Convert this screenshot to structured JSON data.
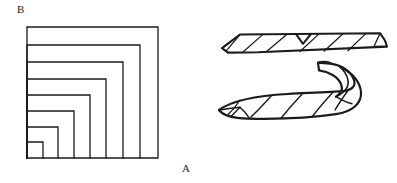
{
  "figure": {
    "background_color": "#ffffff",
    "ink_color": "#1b1b1b",
    "width": 397,
    "height": 183,
    "labels": {
      "corner_b": "B",
      "corner_a": "A"
    },
    "panels": [
      {
        "name": "nested-squares-panel",
        "description": "Eight nested squares sharing a common bottom-left corner, with vertex B at the top-left of the outermost square and vertex A at the bottom-right of the outermost square."
      },
      {
        "name": "flat-strip-panel",
        "description": "A thin flat hatched strip shown in perspective, with a small notch on its upper edge."
      },
      {
        "name": "curved-hook-panel",
        "description": "A long hatched strip whose right end curls upward and back over itself into a hook."
      }
    ]
  },
  "chart_data": {
    "type": "diagram",
    "title": "",
    "nested_squares": {
      "count": 8,
      "shared_corner": "bottom-left",
      "origin": {
        "x": 27,
        "y": 158
      },
      "sizes_px": [
        131,
        113,
        96,
        79,
        63,
        47,
        31,
        16
      ],
      "label_b_at": "top-left of outermost square",
      "label_a_at": "bottom-right of outermost square"
    },
    "flat_strip": {
      "left_tip": {
        "x": 222,
        "y": 48
      },
      "right_tip": {
        "x": 385,
        "y": 47
      },
      "top_edge_y": 35,
      "hatch_line_count": 6,
      "notch": true
    },
    "curved_hook": {
      "left_tip": {
        "x": 219,
        "y": 110
      },
      "body_top_y": 96,
      "hook_apex": {
        "x": 330,
        "y": 66
      },
      "hook_tip": {
        "x": 318,
        "y": 63
      },
      "hatch_line_count": 5
    }
  }
}
